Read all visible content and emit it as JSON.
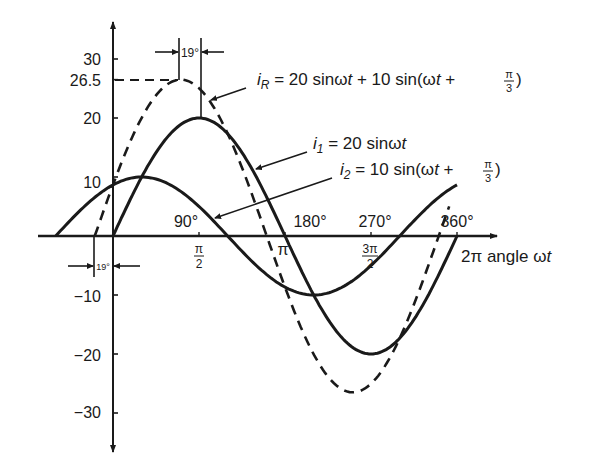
{
  "chart_data": {
    "type": "line",
    "title": "",
    "xlabel": "2π angle ωt",
    "ylabel": "",
    "ylim": [
      -35,
      35
    ],
    "xlim_rad": [
      -1.4,
      6.6
    ],
    "grid": false,
    "x_ticks": [
      {
        "rad": 1.5708,
        "label_rad": "π/2",
        "label_deg": "90°"
      },
      {
        "rad": 3.1416,
        "label_rad": "π",
        "label_deg": "180°"
      },
      {
        "rad": 4.7124,
        "label_rad": "3π/2",
        "label_deg": "270°"
      },
      {
        "rad": 6.2832,
        "label_rad": "2π",
        "label_deg": "360°"
      }
    ],
    "y_ticks": [
      {
        "value": 30,
        "label": "30"
      },
      {
        "value": 26.5,
        "label": "26.5"
      },
      {
        "value": 20,
        "label": "20"
      },
      {
        "value": 10,
        "label": "10"
      },
      {
        "value": -10,
        "label": "-10"
      },
      {
        "value": -20,
        "label": "-20"
      },
      {
        "value": -30,
        "label": "-30"
      }
    ],
    "series": [
      {
        "name": "i1 = 20 sinωt",
        "amplitude": 20,
        "phase_deg": 0,
        "style": "solid",
        "start_rad": 0,
        "end_rad": 6.2832
      },
      {
        "name": "i2 = 10 sin(ωt + π/3)",
        "amplitude": 10,
        "phase_deg": 60,
        "style": "solid",
        "start_rad": -1.0472,
        "end_rad": 6.2832
      },
      {
        "name": "iR = 20 sinωt + 10 sin(ωt + π/3)",
        "amplitude": 26.5,
        "phase_deg": 19.1,
        "style": "dashed",
        "start_rad": -0.3334,
        "end_rad": 6.14
      }
    ],
    "annotations": [
      {
        "text": "19°",
        "meaning": "phase lead of iR over i1 at peak"
      },
      {
        "text": "19°",
        "meaning": "phase lead of iR over i1 at zero crossing"
      },
      {
        "text": "26.5",
        "meaning": "peak of resultant iR"
      }
    ]
  },
  "labels": {
    "ir_label": {
      "i": "i",
      "sub": "R",
      "rest": " = 20 sinω",
      "t": "t",
      "rest2": " + 10 sin(ω",
      "t2": "t",
      "plus": " + ",
      "num": "π",
      "den": "3",
      "close": ")"
    },
    "i1_label": {
      "i": "i",
      "sub": "1",
      "rest": " = 20 sinω",
      "t": "t"
    },
    "i2_label": {
      "i": "i",
      "sub": "2",
      "rest": " = 10 sin(ω",
      "t": "t",
      "plus": " + ",
      "num": "π",
      "den": "3",
      "close": ")"
    },
    "deg_marker": "19°",
    "axis_label_2pi": "2π",
    "axis_label_text": " angle ω",
    "axis_label_t": "t",
    "deg_90": "90°",
    "deg_180": "180°",
    "deg_270": "270°",
    "deg_360": "360°",
    "pi_half_num": "π",
    "pi_half_den": "2",
    "pi": "π",
    "three_pi_half_num": "3π",
    "three_pi_half_den": "2",
    "y30": "30",
    "y265": "26.5",
    "y20": "20",
    "y10": "10",
    "ym10": "−10",
    "ym20": "−20",
    "ym30": "−30"
  },
  "colors": {
    "ink": "#1a1a1a",
    "background": "#ffffff"
  }
}
